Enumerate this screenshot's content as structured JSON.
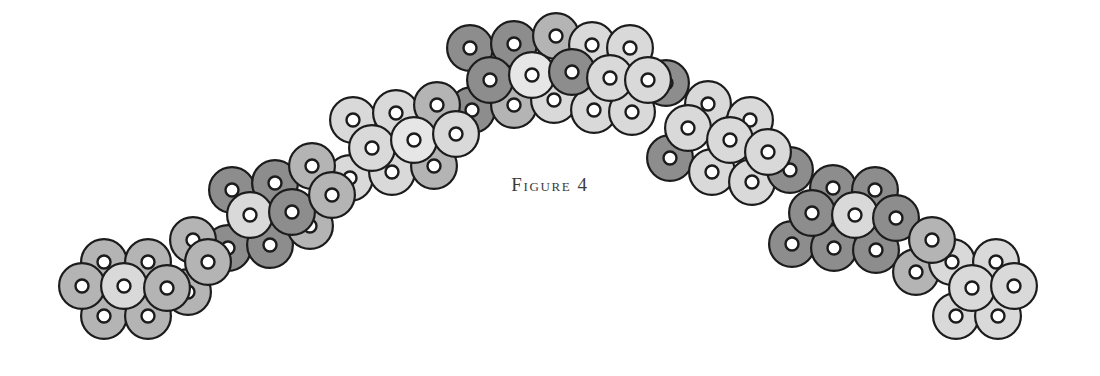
{
  "figure": {
    "caption": "Figure 4",
    "caption_color": "#3a3a3a",
    "background_color": "#ffffff",
    "width": 1100,
    "height": 376
  },
  "chart_data": {
    "type": "scatter",
    "title": "Figure 4",
    "xlabel": "",
    "ylabel": "",
    "xlim": [
      0,
      1100
    ],
    "ylim": [
      376,
      0
    ],
    "grid": false,
    "legend": null,
    "marker": {
      "shape": "annulus",
      "outer_diameter": 48,
      "outline_width": 2.2,
      "outline_color": "#1c1c1c",
      "hole_outer_diameter": 13,
      "hole_stroke_width": 2.4,
      "hole_color": "#1c1c1c",
      "hole_fill": "#ffffff"
    },
    "shade_palette": {
      "dark": "#8d8d8d",
      "medium": "#b4b4b4",
      "light": "#d9d9d9",
      "pale": "#e6e6e6"
    },
    "series": [
      {
        "name": "top-row",
        "points": [
          {
            "x": 104,
            "y": 262,
            "shade": "medium"
          },
          {
            "x": 148,
            "y": 262,
            "shade": "medium"
          },
          {
            "x": 193,
            "y": 240,
            "shade": "medium"
          },
          {
            "x": 232,
            "y": 190,
            "shade": "dark"
          },
          {
            "x": 275,
            "y": 183,
            "shade": "dark"
          },
          {
            "x": 312,
            "y": 166,
            "shade": "medium"
          },
          {
            "x": 353,
            "y": 120,
            "shade": "light"
          },
          {
            "x": 396,
            "y": 113,
            "shade": "light"
          },
          {
            "x": 437,
            "y": 105,
            "shade": "medium"
          },
          {
            "x": 470,
            "y": 48,
            "shade": "dark"
          },
          {
            "x": 514,
            "y": 44,
            "shade": "dark"
          },
          {
            "x": 556,
            "y": 36,
            "shade": "medium"
          },
          {
            "x": 592,
            "y": 45,
            "shade": "light"
          },
          {
            "x": 630,
            "y": 48,
            "shade": "light"
          },
          {
            "x": 666,
            "y": 83,
            "shade": "dark"
          },
          {
            "x": 708,
            "y": 104,
            "shade": "light"
          },
          {
            "x": 750,
            "y": 120,
            "shade": "light"
          },
          {
            "x": 790,
            "y": 170,
            "shade": "dark"
          },
          {
            "x": 833,
            "y": 188,
            "shade": "dark"
          },
          {
            "x": 875,
            "y": 190,
            "shade": "dark"
          },
          {
            "x": 952,
            "y": 262,
            "shade": "light"
          },
          {
            "x": 996,
            "y": 262,
            "shade": "light"
          }
        ]
      },
      {
        "name": "middle-row",
        "points": [
          {
            "x": 82,
            "y": 286,
            "shade": "medium"
          },
          {
            "x": 124,
            "y": 286,
            "shade": "light"
          },
          {
            "x": 167,
            "y": 288,
            "shade": "medium"
          },
          {
            "x": 208,
            "y": 262,
            "shade": "medium"
          },
          {
            "x": 250,
            "y": 215,
            "shade": "light"
          },
          {
            "x": 292,
            "y": 212,
            "shade": "dark"
          },
          {
            "x": 332,
            "y": 195,
            "shade": "medium"
          },
          {
            "x": 372,
            "y": 148,
            "shade": "light"
          },
          {
            "x": 414,
            "y": 140,
            "shade": "pale"
          },
          {
            "x": 456,
            "y": 134,
            "shade": "light"
          },
          {
            "x": 490,
            "y": 80,
            "shade": "dark"
          },
          {
            "x": 532,
            "y": 75,
            "shade": "pale"
          },
          {
            "x": 572,
            "y": 72,
            "shade": "dark"
          },
          {
            "x": 610,
            "y": 78,
            "shade": "light"
          },
          {
            "x": 648,
            "y": 80,
            "shade": "light"
          },
          {
            "x": 688,
            "y": 128,
            "shade": "light"
          },
          {
            "x": 730,
            "y": 140,
            "shade": "light"
          },
          {
            "x": 768,
            "y": 152,
            "shade": "light"
          },
          {
            "x": 812,
            "y": 213,
            "shade": "dark"
          },
          {
            "x": 855,
            "y": 215,
            "shade": "light"
          },
          {
            "x": 896,
            "y": 218,
            "shade": "dark"
          },
          {
            "x": 932,
            "y": 240,
            "shade": "medium"
          },
          {
            "x": 972,
            "y": 288,
            "shade": "light"
          },
          {
            "x": 1014,
            "y": 286,
            "shade": "light"
          }
        ]
      },
      {
        "name": "bottom-row",
        "points": [
          {
            "x": 104,
            "y": 316,
            "shade": "medium"
          },
          {
            "x": 148,
            "y": 316,
            "shade": "medium"
          },
          {
            "x": 188,
            "y": 292,
            "shade": "medium"
          },
          {
            "x": 228,
            "y": 248,
            "shade": "dark"
          },
          {
            "x": 270,
            "y": 245,
            "shade": "dark"
          },
          {
            "x": 310,
            "y": 226,
            "shade": "medium"
          },
          {
            "x": 350,
            "y": 178,
            "shade": "light"
          },
          {
            "x": 392,
            "y": 172,
            "shade": "light"
          },
          {
            "x": 434,
            "y": 166,
            "shade": "medium"
          },
          {
            "x": 472,
            "y": 110,
            "shade": "dark"
          },
          {
            "x": 514,
            "y": 105,
            "shade": "medium"
          },
          {
            "x": 554,
            "y": 100,
            "shade": "light"
          },
          {
            "x": 594,
            "y": 110,
            "shade": "light"
          },
          {
            "x": 632,
            "y": 112,
            "shade": "light"
          },
          {
            "x": 670,
            "y": 158,
            "shade": "dark"
          },
          {
            "x": 712,
            "y": 172,
            "shade": "light"
          },
          {
            "x": 752,
            "y": 182,
            "shade": "light"
          },
          {
            "x": 792,
            "y": 244,
            "shade": "dark"
          },
          {
            "x": 834,
            "y": 248,
            "shade": "dark"
          },
          {
            "x": 876,
            "y": 250,
            "shade": "dark"
          },
          {
            "x": 916,
            "y": 272,
            "shade": "medium"
          },
          {
            "x": 956,
            "y": 316,
            "shade": "light"
          },
          {
            "x": 998,
            "y": 316,
            "shade": "light"
          }
        ]
      }
    ]
  }
}
